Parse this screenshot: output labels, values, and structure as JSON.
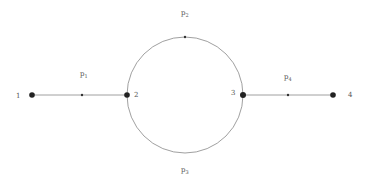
{
  "diagram": {
    "type": "graph",
    "nodes": [
      {
        "id": "1",
        "label": "1",
        "x": 32,
        "y": 95,
        "lx": 16,
        "ly": 98
      },
      {
        "id": "2",
        "label": "2",
        "x": 127,
        "y": 95,
        "lx": 134,
        "ly": 96
      },
      {
        "id": "3",
        "label": "3",
        "x": 243,
        "y": 95,
        "lx": 231,
        "ly": 94
      },
      {
        "id": "4",
        "label": "4",
        "x": 333,
        "y": 95,
        "lx": 348,
        "ly": 97
      }
    ],
    "edges": [
      {
        "id": "p1",
        "from": "1",
        "to": "2",
        "label": "p",
        "sub": "1",
        "shape": "line"
      },
      {
        "id": "p2",
        "from": "3",
        "to": "2",
        "label": "p",
        "sub": "2",
        "shape": "upper-arc"
      },
      {
        "id": "p3",
        "from": "2",
        "to": "3",
        "label": "p",
        "sub": "3",
        "shape": "lower-arc"
      },
      {
        "id": "p4",
        "from": "3",
        "to": "4",
        "label": "p",
        "sub": "4",
        "shape": "line"
      }
    ],
    "colors": {
      "line": "#888888",
      "node": "#222222",
      "label": "#555555"
    }
  }
}
